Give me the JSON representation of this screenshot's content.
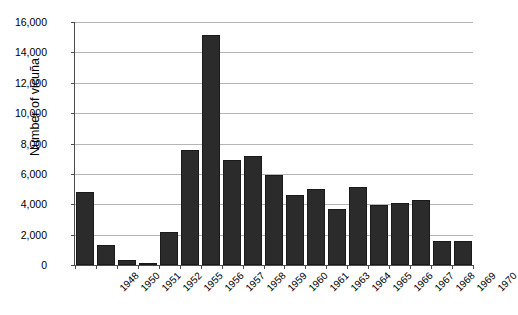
{
  "chart_data": {
    "type": "bar",
    "title": "",
    "xlabel": "",
    "ylabel": "Number of vicuña",
    "ylim": [
      0,
      16000
    ],
    "ytick_values": [
      0,
      2000,
      4000,
      6000,
      8000,
      10000,
      12000,
      14000,
      16000
    ],
    "ytick_labels": [
      "0",
      "2,000",
      "4,000",
      "6,000",
      "8,000",
      "10,000",
      "12,000",
      "14,000",
      "16,000"
    ],
    "grid": true,
    "legend": false,
    "legend_position": "none",
    "bar_color": "#2b2b2b",
    "categories": [
      "1948",
      "1950",
      "1951",
      "1952",
      "1955",
      "1956",
      "1957",
      "1958",
      "1959",
      "1960",
      "1961",
      "1963",
      "1964",
      "1965",
      "1966",
      "1967",
      "1968",
      "1969",
      "1970"
    ],
    "values": [
      4800,
      1350,
      300,
      100,
      2150,
      7600,
      15150,
      6900,
      7200,
      5900,
      4600,
      5000,
      3700,
      5150,
      3950,
      4100,
      4300,
      1600,
      1600
    ]
  }
}
